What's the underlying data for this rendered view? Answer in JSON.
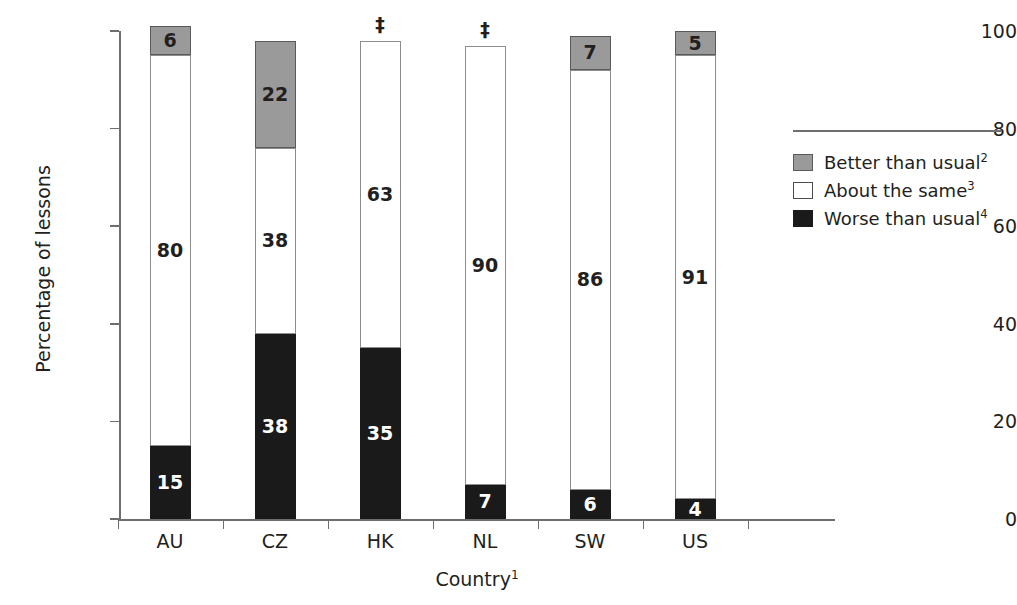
{
  "chart_data": {
    "type": "bar",
    "subtype": "stacked-bar-100",
    "title": "",
    "xlabel": "Country",
    "xlabel_footnote": "1",
    "ylabel": "Percentage of lessons",
    "ylim": [
      0,
      100
    ],
    "yticks": [
      0,
      20,
      40,
      60,
      80,
      100
    ],
    "ytick_labels": [
      "0",
      "20",
      "40",
      "60",
      "80",
      "100"
    ],
    "grid": false,
    "legend_position": "right",
    "categories": [
      "AU",
      "CZ",
      "HK",
      "NL",
      "SW",
      "US"
    ],
    "series": [
      {
        "name": "Better than usual",
        "footnote": "2",
        "color": "#9a9a9a",
        "values": [
          6,
          22,
          null,
          null,
          7,
          5
        ],
        "labels": [
          "6",
          "22",
          "‡",
          "‡",
          "7",
          "5"
        ]
      },
      {
        "name": "About the same",
        "footnote": "3",
        "color": "#ffffff",
        "values": [
          80,
          38,
          63,
          90,
          86,
          91
        ],
        "labels": [
          "80",
          "38",
          "63",
          "90",
          "86",
          "91"
        ]
      },
      {
        "name": "Worse than usual",
        "footnote": "4",
        "color": "#1a1a1a",
        "values": [
          15,
          38,
          35,
          7,
          6,
          4
        ],
        "labels": [
          "15",
          "38",
          "35",
          "7",
          "6",
          "4"
        ]
      }
    ],
    "suppressed_symbol": "‡",
    "suppressed_note": "Reporting standards not met; value suppressed"
  },
  "axes": {
    "y_title": "Percentage of lessons",
    "x_title": "Country",
    "x_title_footnote": "1",
    "ytick_labels": [
      "100",
      "80",
      "60",
      "40",
      "20",
      "0"
    ],
    "category_labels": [
      "AU",
      "CZ",
      "HK",
      "NL",
      "SW",
      "US"
    ]
  },
  "legend": {
    "items": [
      {
        "label": "Better than usual",
        "footnote": "2",
        "swatch": "gray-square-icon"
      },
      {
        "label": "About the same",
        "footnote": "3",
        "swatch": "white-square-icon"
      },
      {
        "label": "Worse than usual",
        "footnote": "4",
        "swatch": "black-square-icon"
      }
    ]
  },
  "colors": {
    "better": "#9a9a9a",
    "same": "#ffffff",
    "worse": "#1a1a1a",
    "axis": "#6d6e71",
    "text": "#231f20"
  }
}
